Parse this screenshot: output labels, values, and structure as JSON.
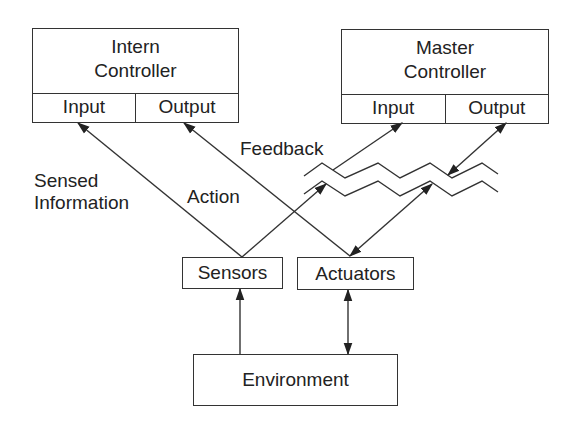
{
  "diagram": {
    "intern_controller": {
      "title_line1": "Intern",
      "title_line2": "Controller",
      "input": "Input",
      "output": "Output"
    },
    "master_controller": {
      "title_line1": "Master",
      "title_line2": "Controller",
      "input": "Input",
      "output": "Output"
    },
    "sensors": "Sensors",
    "actuators": "Actuators",
    "environment": "Environment",
    "labels": {
      "sensed_line1": "Sensed",
      "sensed_line2": "Information",
      "action": "Action",
      "feedback": "Feedback"
    },
    "colors": {
      "line": "#333333",
      "background": "#ffffff"
    }
  }
}
